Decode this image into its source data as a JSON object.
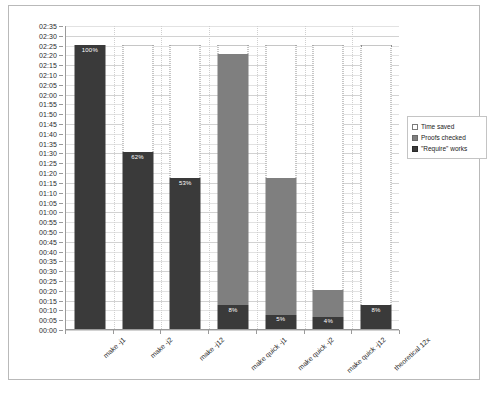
{
  "chart_data": {
    "type": "bar",
    "subtype": "stacked-column",
    "title": "",
    "xlabel": "",
    "ylabel": "",
    "categories": [
      "make -j1",
      "make -j2",
      "make -j12",
      "make quick -j1",
      "make quick -j2",
      "make quick -j12",
      "theoretical 12x"
    ],
    "series": [
      {
        "name": "\"Require\" works",
        "color": "#3a3a3a",
        "values_minutes": [
          145,
          90,
          77,
          12,
          7,
          6,
          12
        ],
        "values_time": [
          "02:25",
          "01:30",
          "01:17",
          "00:12",
          "00:07",
          "00:06",
          "00:12"
        ],
        "data_labels": [
          "100%",
          "62%",
          "53%",
          "8%",
          "5%",
          "4%",
          "8%"
        ]
      },
      {
        "name": "Proofs checked",
        "color": "#7f7f7f",
        "values_minutes": [
          0,
          0,
          0,
          128,
          70,
          14,
          0
        ],
        "values_time": [
          "00:00",
          "00:00",
          "00:00",
          "02:08",
          "01:10",
          "00:14",
          "00:00"
        ],
        "data_labels": [
          "",
          "",
          "",
          "",
          "",
          "",
          ""
        ]
      },
      {
        "name": "Time saved",
        "color": "#ffffff",
        "values_minutes": [
          0,
          55,
          68,
          5,
          68,
          125,
          133
        ],
        "values_time": [
          "00:00",
          "00:55",
          "01:08",
          "00:05",
          "01:08",
          "02:05",
          "02:13"
        ],
        "data_labels": [
          "",
          "",
          "",
          "",
          "",
          "",
          ""
        ]
      }
    ],
    "stack_total_minutes": 145,
    "stack_total_time": "02:25",
    "ylim_minutes": [
      0,
      155
    ],
    "ytick_step_minutes": 5,
    "ytick_labels": [
      "02:35",
      "02:30",
      "02:25",
      "02:20",
      "02:15",
      "02:10",
      "02:05",
      "02:00",
      "01:55",
      "01:50",
      "01:45",
      "01:40",
      "01:35",
      "01:30",
      "01:25",
      "01:20",
      "01:15",
      "01:10",
      "01:05",
      "01:00",
      "00:55",
      "00:50",
      "00:45",
      "00:40",
      "00:35",
      "00:30",
      "00:25",
      "00:20",
      "00:15",
      "00:10",
      "00:05",
      "00:00"
    ],
    "grid": true,
    "legend_position": "right",
    "legend": [
      {
        "label": "Time saved",
        "swatch": "sw-saved"
      },
      {
        "label": "Proofs checked",
        "swatch": "sw-proofs"
      },
      {
        "label": "\"Require\" works",
        "swatch": "sw-works"
      }
    ]
  }
}
